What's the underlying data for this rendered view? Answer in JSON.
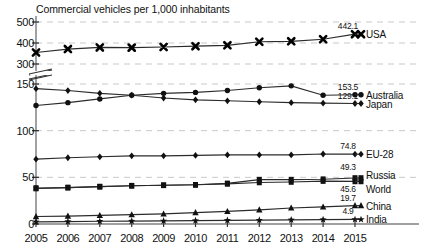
{
  "chart_data": {
    "type": "line",
    "title": "Commercial vehicles per 1,000 inhabitants",
    "xlabel": "",
    "ylabel": "",
    "grid": true,
    "legend_position": "right-inline",
    "axis_break": {
      "between": [
        150,
        300
      ],
      "note": "broken y-axis"
    },
    "yticks_upper": [
      300,
      400,
      500
    ],
    "yticks_lower": [
      0,
      50,
      100,
      150
    ],
    "ylim_upper": [
      300,
      500
    ],
    "ylim_lower": [
      0,
      150
    ],
    "categories": [
      "2005",
      "2006",
      "2007",
      "2008",
      "2009",
      "2010",
      "2011",
      "2012",
      "2013",
      "2014",
      "2015"
    ],
    "series": [
      {
        "name": "USA",
        "marker": "cross",
        "end_label": "442.1",
        "values": [
          355,
          371,
          379,
          378,
          381,
          385,
          389,
          406,
          408,
          418,
          442.1
        ]
      },
      {
        "name": "Australia",
        "marker": "circle",
        "end_label": "153.5",
        "values": [
          127,
          130,
          134,
          138,
          140,
          141,
          143,
          146,
          148,
          151,
          153.5
        ]
      },
      {
        "name": "Japan",
        "marker": "diamond",
        "end_label": "129.1",
        "values": [
          145,
          143,
          140,
          138,
          135,
          133,
          132,
          131,
          130,
          129.5,
          129.1
        ]
      },
      {
        "name": "EU-28",
        "marker": "diamond",
        "end_label": "74.8",
        "values": [
          69.5,
          71,
          72,
          73,
          73,
          73.5,
          74,
          74,
          74,
          75,
          74.8
        ]
      },
      {
        "name": "Russia",
        "marker": "square",
        "end_label": "49.3",
        "values": [
          38.5,
          39,
          40,
          41,
          41.5,
          42,
          43.5,
          47.5,
          47.5,
          48,
          49.3
        ]
      },
      {
        "name": "World",
        "marker": "square",
        "end_label": "45.6",
        "values": [
          38,
          39,
          40,
          41,
          41.5,
          42,
          43,
          44.5,
          45,
          46,
          45.6
        ]
      },
      {
        "name": "China",
        "marker": "triangle",
        "end_label": "19.7",
        "values": [
          8,
          8.5,
          9.2,
          10,
          10.8,
          12.2,
          13.5,
          15.2,
          17.2,
          18.3,
          19.7
        ]
      },
      {
        "name": "India",
        "marker": "star",
        "end_label": "4.9",
        "values": [
          2.3,
          2.6,
          2.9,
          3.1,
          3.3,
          3.6,
          3.9,
          4.1,
          4.4,
          4.7,
          4.9
        ]
      }
    ]
  },
  "colors": {
    "line": "#2b2b2b",
    "grid": "#c9c9c9",
    "axis": "#8a8a8a",
    "text": "#111111"
  }
}
